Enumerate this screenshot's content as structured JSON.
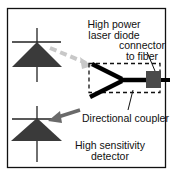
{
  "diagram": {
    "type": "optical-schematic",
    "labels": {
      "laser_line1": "High power",
      "laser_line2": "laser diode",
      "connector_line1": "connector",
      "connector_line2": "to fiber",
      "coupler": "Directional coupler",
      "detector_line1": "High sensitivity",
      "detector_line2": "detector"
    },
    "components": [
      {
        "name": "laser-diode",
        "symbol": "diode-triangle",
        "position": "top-left"
      },
      {
        "name": "detector",
        "symbol": "diode-triangle",
        "position": "bottom-left"
      },
      {
        "name": "directional-coupler",
        "symbol": "y-junction",
        "position": "center-right",
        "enclosure": "dashed-box"
      },
      {
        "name": "fiber-connector",
        "symbol": "square",
        "position": "right"
      }
    ],
    "colors": {
      "frame": "#111111",
      "diode": "#3a3a3a",
      "connector": "#4a4a4a",
      "beam_laser": "#c8c8c8",
      "beam_detector": "#6a6a6a",
      "fiber": "#000000"
    }
  }
}
